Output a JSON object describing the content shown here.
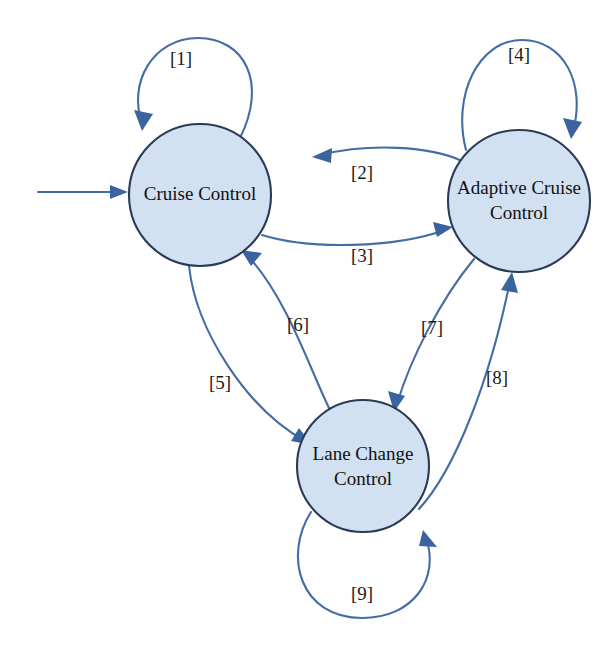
{
  "diagram": {
    "type": "state-transition-diagram",
    "colors": {
      "node_fill": "#d2e1f2",
      "node_stroke": "#2b3a57",
      "edge": "#456ca4",
      "arrow_head": "#3a63a0",
      "label_text": "#1a1a1a",
      "background": "#ffffff"
    },
    "states": [
      {
        "id": "cruise-control",
        "line1": "Cruise Control",
        "line2": "",
        "cx": 200,
        "cy": 195,
        "r": 71
      },
      {
        "id": "adaptive-cruise-control",
        "line1": "Adaptive Cruise",
        "line2": "Control",
        "cx": 519,
        "cy": 201,
        "r": 71
      },
      {
        "id": "lane-change-control",
        "line1": "Lane Change",
        "line2": "Control",
        "cx": 363,
        "cy": 466,
        "r": 66
      }
    ],
    "initial_arrow": {
      "id": "initial-transition",
      "from_x": 38,
      "to_x": 128,
      "y": 192
    },
    "transitions": [
      {
        "id": "t1",
        "label": "[1]",
        "from": "cruise-control",
        "to": "cruise-control",
        "label_x": 181,
        "label_y": 61
      },
      {
        "id": "t2",
        "label": "[2]",
        "from": "adaptive-cruise-control",
        "to": "cruise-control",
        "label_x": 362,
        "label_y": 175
      },
      {
        "id": "t3",
        "label": "[3]",
        "from": "cruise-control",
        "to": "adaptive-cruise-control",
        "label_x": 362,
        "label_y": 258
      },
      {
        "id": "t4",
        "label": "[4]",
        "from": "adaptive-cruise-control",
        "to": "adaptive-cruise-control",
        "label_x": 519,
        "label_y": 57
      },
      {
        "id": "t5",
        "label": "[5]",
        "from": "cruise-control",
        "to": "lane-change-control",
        "label_x": 220,
        "label_y": 385
      },
      {
        "id": "t6",
        "label": "[6]",
        "from": "lane-change-control",
        "to": "cruise-control",
        "label_x": 298,
        "label_y": 327
      },
      {
        "id": "t7",
        "label": "[7]",
        "from": "adaptive-cruise-control",
        "to": "lane-change-control",
        "label_x": 432,
        "label_y": 330
      },
      {
        "id": "t8",
        "label": "[8]",
        "from": "lane-change-control",
        "to": "adaptive-cruise-control",
        "label_x": 497,
        "label_y": 380
      },
      {
        "id": "t9",
        "label": "[9]",
        "from": "lane-change-control",
        "to": "lane-change-control",
        "label_x": 362,
        "label_y": 596
      }
    ]
  }
}
